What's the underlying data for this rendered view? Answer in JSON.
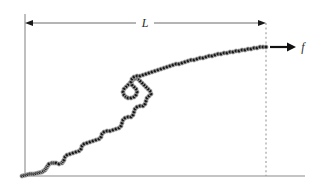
{
  "figure": {
    "type": "diagram",
    "background_color": "#ffffff",
    "width": 325,
    "height": 190
  },
  "labels": {
    "length_label": "L",
    "force_label": "f"
  },
  "colors": {
    "axis_line": "#8a8a8a",
    "dimension_line": "#5a5a5a",
    "dashed_line": "#9a9a9a",
    "force_arrow": "#111111",
    "chain_bead_fill": "#1a1a1a",
    "chain_bead_stroke": "#b8b8b8",
    "chain_backbone": "#3a3a3a",
    "text": "#2b2b2b"
  },
  "geometry": {
    "left_axis": {
      "x": 25,
      "y_top": 14,
      "y_bottom": 176
    },
    "bottom_axis": {
      "y": 176,
      "x_start": 25,
      "x_end": 305
    },
    "dimension_line": {
      "y": 23,
      "x_left": 25,
      "x_right": 266,
      "label_x": 145
    },
    "dashed_vertical": {
      "x": 266,
      "y_top": 23,
      "y_bottom": 176
    },
    "force_arrow": {
      "x_start": 270,
      "x_end": 296,
      "y": 47
    },
    "force_label_pos": {
      "x": 303,
      "y": 51
    },
    "chain_start": {
      "x": 22,
      "y": 176
    },
    "chain_end": {
      "x": 266,
      "y": 47
    }
  },
  "chain": {
    "bead_count": 150,
    "bead_radius": 2.1,
    "description": "linked-bead polymer chain from lower-left anchor to upper-right force point",
    "path_points": [
      [
        22,
        176
      ],
      [
        26,
        175
      ],
      [
        30,
        174
      ],
      [
        34,
        174
      ],
      [
        38,
        173
      ],
      [
        42,
        172
      ],
      [
        45,
        170
      ],
      [
        47,
        167
      ],
      [
        49,
        164
      ],
      [
        52,
        163
      ],
      [
        56,
        163
      ],
      [
        59,
        164
      ],
      [
        62,
        163
      ],
      [
        64,
        160
      ],
      [
        65,
        157
      ],
      [
        67,
        155
      ],
      [
        70,
        154
      ],
      [
        73,
        153
      ],
      [
        76,
        152
      ],
      [
        79,
        151
      ],
      [
        81,
        149
      ],
      [
        82,
        146
      ],
      [
        84,
        144
      ],
      [
        87,
        143
      ],
      [
        90,
        142
      ],
      [
        93,
        141
      ],
      [
        96,
        140
      ],
      [
        99,
        139
      ],
      [
        101,
        137
      ],
      [
        102,
        134
      ],
      [
        104,
        132
      ],
      [
        107,
        131
      ],
      [
        110,
        131
      ],
      [
        113,
        130
      ],
      [
        116,
        129
      ],
      [
        119,
        128
      ],
      [
        121,
        126
      ],
      [
        122,
        123
      ],
      [
        123,
        120
      ],
      [
        125,
        118
      ],
      [
        128,
        117
      ],
      [
        131,
        117
      ],
      [
        133,
        115
      ],
      [
        134,
        112
      ],
      [
        135,
        109
      ],
      [
        137,
        107
      ],
      [
        140,
        106
      ],
      [
        143,
        106
      ],
      [
        145,
        104
      ],
      [
        146,
        101
      ],
      [
        147,
        98
      ],
      [
        149,
        96
      ],
      [
        151,
        94
      ],
      [
        150,
        91
      ],
      [
        148,
        89
      ],
      [
        146,
        87
      ],
      [
        144,
        85
      ],
      [
        142,
        83
      ],
      [
        140,
        81
      ],
      [
        138,
        79
      ],
      [
        136,
        78
      ],
      [
        134,
        79
      ],
      [
        132,
        81
      ],
      [
        130,
        83
      ],
      [
        128,
        85
      ],
      [
        126,
        87
      ],
      [
        124,
        89
      ],
      [
        123,
        92
      ],
      [
        124,
        95
      ],
      [
        126,
        97
      ],
      [
        128,
        98
      ],
      [
        131,
        98
      ],
      [
        134,
        97
      ],
      [
        136,
        95
      ],
      [
        137,
        92
      ],
      [
        136,
        89
      ],
      [
        134,
        87
      ],
      [
        132,
        85
      ],
      [
        131,
        82
      ],
      [
        132,
        79
      ],
      [
        134,
        77
      ],
      [
        137,
        76
      ],
      [
        140,
        76
      ],
      [
        143,
        75
      ],
      [
        146,
        74
      ],
      [
        149,
        73
      ],
      [
        152,
        72
      ],
      [
        155,
        71
      ],
      [
        158,
        70
      ],
      [
        161,
        69
      ],
      [
        164,
        68
      ],
      [
        167,
        67
      ],
      [
        170,
        66
      ],
      [
        173,
        65
      ],
      [
        176,
        64
      ],
      [
        179,
        64
      ],
      [
        182,
        63
      ],
      [
        185,
        62
      ],
      [
        188,
        61
      ],
      [
        191,
        60
      ],
      [
        194,
        60
      ],
      [
        197,
        59
      ],
      [
        200,
        58
      ],
      [
        203,
        58
      ],
      [
        206,
        57
      ],
      [
        209,
        56
      ],
      [
        212,
        56
      ],
      [
        215,
        55
      ],
      [
        218,
        54
      ],
      [
        221,
        54
      ],
      [
        224,
        53
      ],
      [
        227,
        53
      ],
      [
        230,
        52
      ],
      [
        233,
        52
      ],
      [
        236,
        51
      ],
      [
        239,
        51
      ],
      [
        242,
        50
      ],
      [
        245,
        50
      ],
      [
        248,
        49
      ],
      [
        251,
        49
      ],
      [
        254,
        48
      ],
      [
        257,
        48
      ],
      [
        260,
        47
      ],
      [
        263,
        47
      ],
      [
        266,
        47
      ]
    ]
  }
}
